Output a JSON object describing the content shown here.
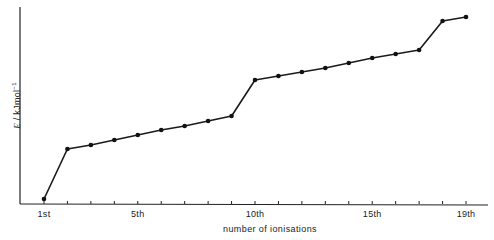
{
  "chart_data": {
    "type": "line",
    "title": "",
    "xlabel": "number of ionisations",
    "ylabel": "E / kJmol⁻¹",
    "x": [
      1,
      2,
      3,
      4,
      5,
      6,
      7,
      8,
      9,
      10,
      11,
      12,
      13,
      14,
      15,
      16,
      17,
      18,
      19
    ],
    "series": [
      {
        "name": "successive ionisation energies (relative)",
        "values": [
          5,
          55,
          59,
          64,
          69,
          74,
          78,
          83,
          88,
          124,
          128,
          132,
          136,
          141,
          146,
          150,
          154,
          183,
          187
        ]
      }
    ],
    "x_tick_labels": [
      {
        "pos": 1,
        "label": "1st"
      },
      {
        "pos": 5,
        "label": "5th"
      },
      {
        "pos": 10,
        "label": "10th"
      },
      {
        "pos": 15,
        "label": "15th"
      },
      {
        "pos": 19,
        "label": "19th"
      }
    ],
    "y_ticks": "none (relative scale, unlabeled)",
    "grid": false,
    "legend": "none"
  },
  "axes": {
    "x_title": "number of ionisations",
    "y_title_prefix": "E",
    "y_title_suffix": " / kJmol",
    "y_title_exp": "−1"
  },
  "ticks": [
    "1st",
    "5th",
    "10th",
    "15th",
    "19th"
  ]
}
